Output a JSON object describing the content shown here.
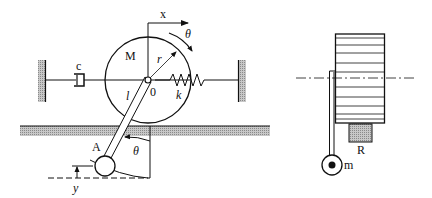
{
  "figure": {
    "left_panel": {
      "title": "Rolling disk with pendulum, spring and damper (side view)",
      "labels": {
        "x_axis": "x",
        "theta_top": "θ",
        "mass": "M",
        "radius": "r",
        "center": "0",
        "damper": "c",
        "spring": "k",
        "length": "l",
        "pendulum_point": "A",
        "theta_bottom": "θ",
        "vertical_disp": "y"
      }
    },
    "right_panel": {
      "title": "Drum with pendulum (front view)",
      "labels": {
        "pendulum_mass": "m",
        "radius_block": "R"
      }
    },
    "colors": {
      "stroke": "#111111",
      "hatch": "#9a9a9a",
      "background": "#ffffff"
    }
  }
}
